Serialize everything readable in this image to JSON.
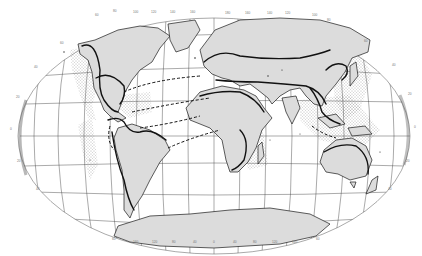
{
  "map": {
    "projection": "elliptical world projection (Robinson-like)",
    "colors": {
      "background": "#ffffff",
      "land": "#dcdcdc",
      "coast": "#1a1a1a",
      "graticule": "#333333",
      "stipple": "#666666",
      "range_boundary": "#111111",
      "route": "#111111",
      "edge_shadow": "#b8b8b8"
    },
    "graticule_labels": {
      "top": [
        "60",
        "80",
        "100",
        "120",
        "140",
        "160",
        "180",
        "160",
        "140",
        "120",
        "100",
        "80"
      ],
      "left": [
        "60",
        "40",
        "20",
        "0",
        "20",
        "40"
      ],
      "right": [
        "60",
        "40",
        "20",
        "0",
        "20",
        "40"
      ],
      "bottom": [
        "60",
        "160",
        "120",
        "80",
        "40",
        "0",
        "40",
        "80",
        "120",
        "160",
        "60"
      ]
    },
    "legend": {
      "land": "Land area",
      "stippled": "Stippled zones",
      "thick_line": "Distribution boundary",
      "dashed_line": "Dispersal routes"
    }
  }
}
